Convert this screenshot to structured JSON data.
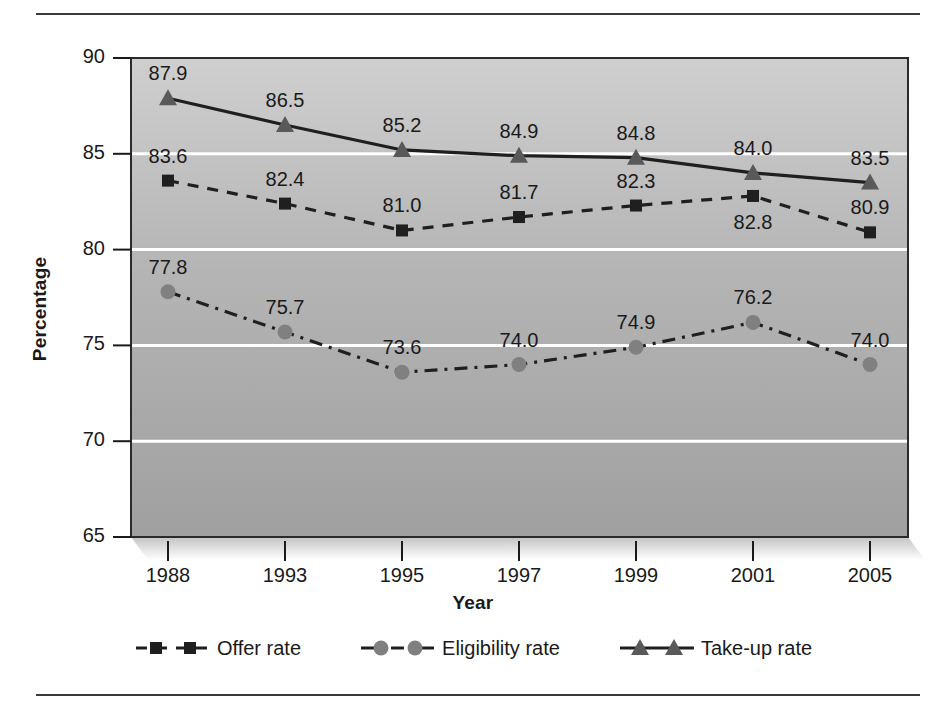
{
  "chart_data": {
    "type": "line",
    "title": "",
    "xlabel": "Year",
    "ylabel": "Percentage",
    "categories": [
      "1988",
      "1993",
      "1995",
      "1997",
      "1999",
      "2001",
      "2005"
    ],
    "ylim": [
      65,
      90
    ],
    "yticks": [
      "65",
      "70",
      "75",
      "80",
      "85",
      "90"
    ],
    "ytick_values": [
      65,
      70,
      75,
      80,
      85,
      90
    ],
    "grid": "horizontal",
    "legend_position": "bottom",
    "series": [
      {
        "name": "Offer rate",
        "marker": "square",
        "line_style": "dashed",
        "color": "#262626",
        "values": [
          83.6,
          82.4,
          81.0,
          81.7,
          82.3,
          82.8,
          80.9
        ],
        "labels": [
          "83.6",
          "82.4",
          "81.0",
          "81.7",
          "82.3",
          "82.8",
          "80.9"
        ],
        "label_positions": [
          "above",
          "above",
          "above",
          "above",
          "above",
          "below",
          "above"
        ]
      },
      {
        "name": "Eligibility rate",
        "marker": "circle",
        "line_style": "dash-dot",
        "color": "#808080",
        "values": [
          77.8,
          75.7,
          73.6,
          74.0,
          74.9,
          76.2,
          74.0
        ],
        "labels": [
          "77.8",
          "75.7",
          "73.6",
          "74.0",
          "74.9",
          "76.2",
          "74.0"
        ],
        "label_positions": [
          "above",
          "above",
          "above",
          "above",
          "above",
          "above",
          "above"
        ]
      },
      {
        "name": "Take-up rate",
        "marker": "triangle",
        "line_style": "solid",
        "color": "#595959",
        "values": [
          87.9,
          86.5,
          85.2,
          84.9,
          84.8,
          84.0,
          83.5
        ],
        "labels": [
          "87.9",
          "86.5",
          "85.2",
          "84.9",
          "84.8",
          "84.0",
          "83.5"
        ],
        "label_positions": [
          "above",
          "above",
          "above",
          "above",
          "above",
          "above",
          "above"
        ]
      }
    ]
  },
  "legend": {
    "items": [
      {
        "label": "Offer rate",
        "icon": "dashed-square-marker-icon"
      },
      {
        "label": "Eligibility rate",
        "icon": "dashdot-circle-marker-icon"
      },
      {
        "label": "Take-up rate",
        "icon": "solid-triangle-marker-icon"
      }
    ]
  },
  "colors": {
    "plot_bg_top": "#cccccc",
    "plot_bg_bottom": "#a0a0a0",
    "gridline": "#ffffff",
    "axis": "#1a1a1a",
    "offer_rate": "#262626",
    "eligibility_rate": "#808080",
    "take_up_rate": "#595959"
  }
}
